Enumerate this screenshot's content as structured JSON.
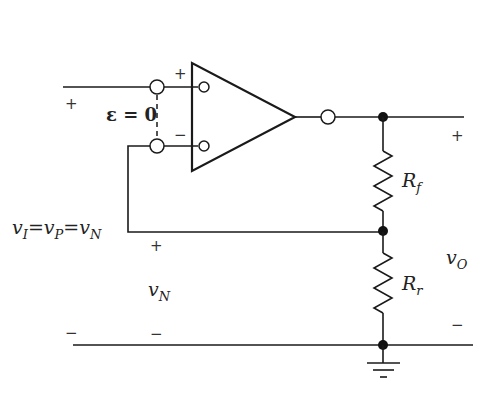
{
  "diagram": {
    "colors": {
      "ink": "#1a1a1a",
      "background": "#ffffff"
    },
    "opamp": {
      "plus_label": "+",
      "minus_label": "−"
    },
    "labels": {
      "epsilon": "ε = 0",
      "input_relation_v1": "v",
      "input_relation_s1": "I",
      "input_relation_eq1": "=",
      "input_relation_v2": "v",
      "input_relation_s2": "P",
      "input_relation_eq2": "=",
      "input_relation_v3": "v",
      "input_relation_s3": "N",
      "vn_v": "v",
      "vn_sub": "N",
      "vo_v": "v",
      "vo_sub": "O",
      "rf_r": "R",
      "rf_sub": "f",
      "rr_r": "R",
      "rr_sub": "r"
    },
    "polarity": {
      "input_plus": "+",
      "input_minus": "−",
      "vn_plus": "+",
      "vn_minus": "−",
      "vo_plus": "+",
      "vo_minus": "−"
    },
    "components": [
      {
        "id": "opamp",
        "type": "op-amp"
      },
      {
        "id": "Rf",
        "type": "resistor",
        "label": "Rf"
      },
      {
        "id": "Rr",
        "type": "resistor",
        "label": "Rr"
      },
      {
        "id": "gnd",
        "type": "ground"
      }
    ]
  }
}
